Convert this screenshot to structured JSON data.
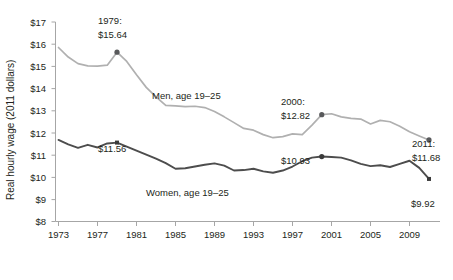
{
  "chart_data": {
    "type": "line",
    "title": "",
    "xlabel": "",
    "ylabel": "Real hourly wage (2011 dollars)",
    "xlim": [
      1973,
      2011
    ],
    "ylim": [
      8,
      17
    ],
    "grid": false,
    "legend_position": "inline-labels",
    "x_tick_labels": [
      "1973",
      "1977",
      "1981",
      "1985",
      "1989",
      "1993",
      "1997",
      "2001",
      "2005",
      "2009"
    ],
    "x_ticks": [
      1973,
      1977,
      1981,
      1985,
      1989,
      1993,
      1997,
      2001,
      2005,
      2009
    ],
    "y_tick_labels": [
      "$8",
      "$9",
      "$10",
      "$11",
      "$12",
      "$13",
      "$14",
      "$15",
      "$16",
      "$17"
    ],
    "y_ticks": [
      8,
      9,
      10,
      11,
      12,
      13,
      14,
      15,
      16,
      17
    ],
    "x": [
      1973,
      1974,
      1975,
      1976,
      1977,
      1978,
      1979,
      1980,
      1981,
      1982,
      1983,
      1984,
      1985,
      1986,
      1987,
      1988,
      1989,
      1990,
      1991,
      1992,
      1993,
      1994,
      1995,
      1996,
      1997,
      1998,
      1999,
      2000,
      2001,
      2002,
      2003,
      2004,
      2005,
      2006,
      2007,
      2008,
      2009,
      2010,
      2011
    ],
    "series": [
      {
        "name": "Men, age 19–25",
        "color": "#b0b0b0",
        "values": [
          15.85,
          15.42,
          15.12,
          15.02,
          15.01,
          15.05,
          15.64,
          15.22,
          14.62,
          14.05,
          13.62,
          13.24,
          13.22,
          13.18,
          13.2,
          13.14,
          12.96,
          12.72,
          12.46,
          12.2,
          12.12,
          11.92,
          11.78,
          11.83,
          11.95,
          11.92,
          12.35,
          12.82,
          12.86,
          12.72,
          12.65,
          12.62,
          12.4,
          12.56,
          12.5,
          12.3,
          12.05,
          11.86,
          11.68
        ]
      },
      {
        "name": "Women, age 19–25",
        "color": "#4d4d4d",
        "values": [
          11.68,
          11.48,
          11.32,
          11.46,
          11.34,
          11.52,
          11.56,
          11.38,
          11.2,
          11.02,
          10.84,
          10.63,
          10.38,
          10.4,
          10.48,
          10.56,
          10.62,
          10.52,
          10.3,
          10.32,
          10.38,
          10.26,
          10.2,
          10.3,
          10.48,
          10.72,
          10.88,
          10.93,
          10.91,
          10.88,
          10.76,
          10.6,
          10.5,
          10.54,
          10.46,
          10.6,
          10.74,
          10.42,
          9.92
        ]
      }
    ],
    "annotations": [
      {
        "id": "men-1979",
        "year_label": "1979:",
        "value_label": "$15.64",
        "x": 1979,
        "y": 15.64,
        "series": "men"
      },
      {
        "id": "men-2000",
        "year_label": "2000:",
        "value_label": "$12.82",
        "x": 2000,
        "y": 12.82,
        "series": "men"
      },
      {
        "id": "men-2011",
        "year_label": "2011:",
        "value_label": "$11.68",
        "x": 2011,
        "y": 11.68,
        "series": "men"
      },
      {
        "id": "women-1979",
        "year_label": "",
        "value_label": "$11.56",
        "x": 1979,
        "y": 11.56,
        "series": "women"
      },
      {
        "id": "women-2000",
        "year_label": "",
        "value_label": "$10.93",
        "x": 2000,
        "y": 10.93,
        "series": "women"
      },
      {
        "id": "women-2011",
        "year_label": "",
        "value_label": "$9.92",
        "x": 2011,
        "y": 9.92,
        "series": "women"
      }
    ],
    "series_inline_labels": [
      {
        "id": "men-label",
        "text": "Men, age 19–25"
      },
      {
        "id": "women-label",
        "text": "Women, age 19–25"
      }
    ]
  },
  "axis": {
    "y_title": "Real hourly wage (2011 dollars)"
  },
  "annotation_text": {
    "men_1979_year": "1979:",
    "men_1979_value": "$15.64",
    "men_2000_year": "2000:",
    "men_2000_value": "$12.82",
    "men_2011_year": "2011:",
    "men_2011_value": "$11.68",
    "women_1979_value": "$11.56",
    "women_2000_value": "$10.93",
    "women_2011_value": "$9.92",
    "men_series": "Men, age 19–25",
    "women_series": "Women, age 19–25"
  },
  "ticks": {
    "y": [
      "$17",
      "$16",
      "$15",
      "$14",
      "$13",
      "$12",
      "$11",
      "$10",
      "$9",
      "$8"
    ],
    "x": [
      "1973",
      "1977",
      "1981",
      "1985",
      "1989",
      "1993",
      "1997",
      "2001",
      "2005",
      "2009"
    ]
  }
}
